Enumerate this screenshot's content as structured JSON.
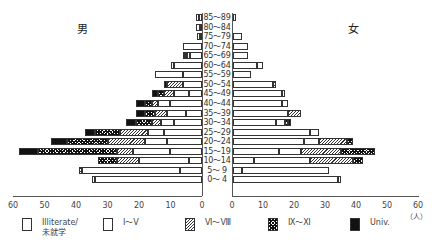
{
  "chart_data": {
    "type": "bar",
    "subtype": "population-pyramid-stacked",
    "title": "",
    "left_label": "男",
    "right_label": "女",
    "xlabel_unit": "（人）",
    "xlim": [
      0,
      60
    ],
    "x_ticks_left": [
      "60",
      "50",
      "40",
      "30",
      "20",
      "10",
      "0"
    ],
    "x_ticks_right": [
      "0",
      "10",
      "20",
      "30",
      "40",
      "50",
      "60"
    ],
    "categories": [
      "85～89",
      "80～84",
      "75～79",
      "70～74",
      "65～69",
      "60～64",
      "55～59",
      "50～54",
      "45～49",
      "40～44",
      "35～39",
      "30～34",
      "25～29",
      "20～24",
      "15～19",
      "10～14",
      "5～ 9",
      "0～ 4"
    ],
    "segments": [
      "Illiterate/未就学",
      "Ⅰ～Ⅴ",
      "Ⅵ～Ⅷ",
      "Ⅸ～Ⅺ",
      "Univ."
    ],
    "male": [
      [
        1,
        1,
        0,
        0,
        0
      ],
      [
        0.5,
        1.5,
        0,
        0,
        0
      ],
      [
        0.5,
        1,
        0,
        0,
        0
      ],
      [
        6,
        0,
        0,
        0,
        0
      ],
      [
        4,
        1,
        0,
        0.5,
        0.5
      ],
      [
        9,
        1,
        0,
        0,
        0
      ],
      [
        6,
        9,
        0,
        0,
        0
      ],
      [
        6,
        0,
        5,
        0,
        1
      ],
      [
        4,
        5,
        3,
        2,
        2
      ],
      [
        10,
        4,
        2,
        2,
        3
      ],
      [
        5,
        6,
        4,
        3,
        3
      ],
      [
        9,
        4,
        3,
        5,
        3
      ],
      [
        12,
        5,
        9,
        8,
        3
      ],
      [
        11,
        7,
        12,
        13,
        5
      ],
      [
        10,
        12,
        5,
        25,
        6
      ],
      [
        4,
        16,
        7,
        6,
        0
      ],
      [
        7,
        31,
        1,
        0,
        0
      ],
      [
        34,
        1,
        0,
        0,
        0
      ]
    ],
    "female": [
      [
        1,
        0,
        0,
        0,
        0
      ],
      [
        0,
        0,
        0,
        0,
        0
      ],
      [
        3,
        0,
        0,
        0,
        0
      ],
      [
        5,
        0,
        0,
        0,
        0
      ],
      [
        5,
        0,
        0,
        0,
        0
      ],
      [
        8,
        2,
        0,
        0,
        0
      ],
      [
        6,
        0,
        0,
        0,
        0
      ],
      [
        13,
        0,
        1,
        0,
        0
      ],
      [
        16,
        1,
        0,
        0,
        0
      ],
      [
        16,
        2,
        0,
        0,
        0
      ],
      [
        18,
        0,
        4,
        0,
        0
      ],
      [
        14,
        3,
        0,
        1,
        1
      ],
      [
        25,
        3,
        0,
        0,
        0
      ],
      [
        23,
        5,
        9,
        2,
        0
      ],
      [
        15,
        7,
        13,
        11,
        0
      ],
      [
        7,
        18,
        14,
        3,
        0
      ],
      [
        3,
        28,
        0,
        0,
        0
      ],
      [
        34,
        1,
        0,
        0,
        0
      ]
    ],
    "legend_position": "bottom",
    "grid": false
  },
  "legend": [
    {
      "label_line1": "Illiterate/",
      "label_line2": "未就学",
      "pattern": "blank"
    },
    {
      "label_line1": "Ⅰ～Ⅴ",
      "label_line2": "",
      "pattern": "dots"
    },
    {
      "label_line1": "Ⅵ～Ⅷ",
      "label_line2": "",
      "pattern": "diagonal"
    },
    {
      "label_line1": "Ⅸ～Ⅺ",
      "label_line2": "",
      "pattern": "diamonds"
    },
    {
      "label_line1": "Univ.",
      "label_line2": "",
      "pattern": "solid"
    }
  ]
}
